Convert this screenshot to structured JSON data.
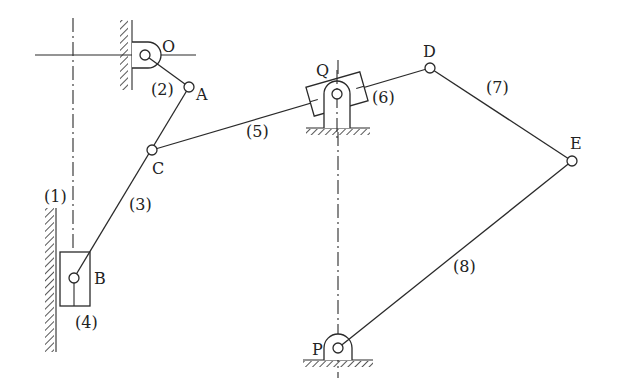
{
  "diagram": {
    "type": "planar-linkage-mechanism",
    "labels": {
      "O": "O",
      "A": "A",
      "B": "B",
      "C": "C",
      "D": "D",
      "E": "E",
      "P": "P",
      "Q": "Q"
    },
    "links": {
      "l1": "(1)",
      "l2": "(2)",
      "l3": "(3)",
      "l4": "(4)",
      "l5": "(5)",
      "l6": "(6)",
      "l7": "(7)",
      "l8": "(8)"
    },
    "colors": {
      "ink": "#2a2a2a",
      "background": "#ffffff"
    }
  }
}
